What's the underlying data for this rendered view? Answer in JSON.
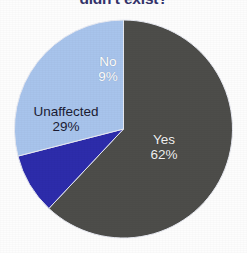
{
  "chart_data": {
    "type": "pie",
    "title": "didn't exist?",
    "title_color": "#33336b",
    "title_clipped": true,
    "categories": [
      "Yes",
      "No",
      "Unaffected"
    ],
    "values": [
      62,
      9,
      29
    ],
    "value_suffix": "%",
    "colors": [
      "#4d4d4a",
      "#2d2cab",
      "#a8c4ec"
    ],
    "label_text_colors": [
      "#f2f2f2",
      "#ffffff",
      "#1b1b33"
    ],
    "start_angle_deg": 0,
    "direction": "clockwise",
    "legend": "none",
    "grid": false,
    "background": "#fdfdfd",
    "slices": [
      {
        "label": "Yes",
        "value": 62,
        "value_label": "62%",
        "color": "#4d4d4a",
        "text_color": "#f2f2f2"
      },
      {
        "label": "No",
        "value": 9,
        "value_label": "9%",
        "color": "#2d2cab",
        "text_color": "#ffffff"
      },
      {
        "label": "Unaffected",
        "value": 29,
        "value_label": "29%",
        "color": "#a8c4ec",
        "text_color": "#1b1b33"
      }
    ]
  },
  "geometry": {
    "center_x": 123.5,
    "center_y": 129,
    "radius": 109
  }
}
